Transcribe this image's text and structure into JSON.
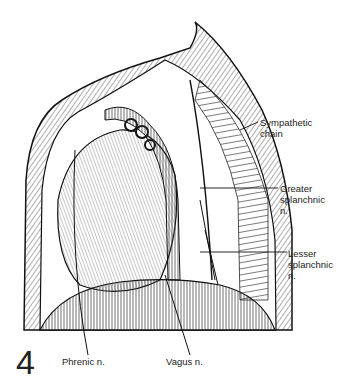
{
  "figure": {
    "number": "4",
    "labels": {
      "sympathetic_chain": "Sympathetic\nchain",
      "greater_splanchnic": "Greater\nsplanchnic\nn.",
      "lesser_splanchnic": "Lesser\nsplanchnic\nn.",
      "phrenic": "Phrenic n.",
      "vagus": "Vagus n."
    },
    "colors": {
      "ink": "#1a1a1a",
      "background": "#ffffff"
    }
  }
}
